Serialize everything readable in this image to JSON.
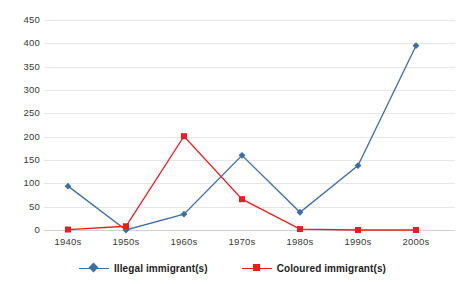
{
  "chart_data": {
    "type": "line",
    "title": "",
    "subtitle": "",
    "xlabel": "",
    "ylabel": "",
    "categories": [
      "1940s",
      "1950s",
      "1960s",
      "1970s",
      "1980s",
      "1990s",
      "2000s"
    ],
    "series": [
      {
        "name": "Illegal immigrant(s)",
        "color": "#3e6da3",
        "marker": "diamond",
        "values": [
          94,
          0,
          34,
          160,
          38,
          138,
          395
        ]
      },
      {
        "name": "Coloured immigrant(s)",
        "color": "#ea1c21",
        "marker": "square",
        "values": [
          1,
          8,
          201,
          66,
          2,
          0,
          0
        ]
      }
    ],
    "ylim": [
      0,
      450
    ],
    "yticks": [
      0,
      50,
      100,
      150,
      200,
      250,
      300,
      350,
      400,
      450
    ],
    "ytick_labels": [
      "0",
      "50",
      "100",
      "150",
      "200",
      "250",
      "300",
      "350",
      "400",
      "450"
    ],
    "grid": true,
    "grid_axis": "y",
    "grid_color": "#e6e6e6",
    "legend_position": "bottom",
    "background_color": "#ffffff"
  },
  "legend": {
    "entries": [
      {
        "label": "Illegal immigrant(s)",
        "marker_name": "diamond-marker"
      },
      {
        "label": "Coloured immigrant(s)",
        "marker_name": "square-marker"
      }
    ]
  }
}
